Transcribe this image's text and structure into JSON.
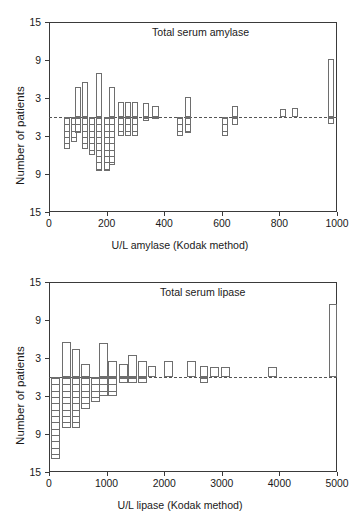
{
  "figure": {
    "panels": [
      {
        "id": "amylase",
        "title": "Total serum amylase",
        "ylabel": "Number of patients",
        "xlabel": "U/L amylase (Kodak method)"
      },
      {
        "id": "lipase",
        "title": "Total serum lipase",
        "ylabel": "Number of patients",
        "xlabel": "U/L lipase (Kodak method)"
      }
    ]
  },
  "chart_data": [
    {
      "type": "bar",
      "id": "amylase",
      "title": "Total serum amylase",
      "xlabel": "U/L amylase (Kodak method)",
      "ylabel": "Number of patients",
      "xlim": [
        0,
        1000
      ],
      "xticks": [
        0,
        200,
        400,
        600,
        800,
        1000
      ],
      "xticklabels": [
        "0",
        "200",
        "400",
        "600",
        "800",
        "1000"
      ],
      "ylim": [
        -15,
        15
      ],
      "yticks": [
        15,
        9,
        3,
        -3,
        -9,
        -15
      ],
      "yticklabels": [
        "15",
        "9",
        "3",
        "3",
        "9",
        "15"
      ],
      "grid": false,
      "legend": null,
      "baseline": 0,
      "baseline_style": "dashed",
      "note": "Bidirectional bars: open bars above the zero baseline, horizontally hatched bars below; bin width 25 U/L.",
      "bins": [
        {
          "x": 62,
          "up": 0,
          "down": 5
        },
        {
          "x": 87,
          "up": 0,
          "down": 4
        },
        {
          "x": 100,
          "up": 4.7,
          "down": 2.5
        },
        {
          "x": 125,
          "up": 5.5,
          "down": 5
        },
        {
          "x": 150,
          "up": 0,
          "down": 6
        },
        {
          "x": 175,
          "up": 7.0,
          "down": 8.5
        },
        {
          "x": 200,
          "up": 0,
          "down": 8.5
        },
        {
          "x": 218,
          "up": 4.7,
          "down": 7.5
        },
        {
          "x": 250,
          "up": 2.4,
          "down": 3
        },
        {
          "x": 275,
          "up": 2.4,
          "down": 3
        },
        {
          "x": 300,
          "up": 2.4,
          "down": 3
        },
        {
          "x": 337,
          "up": 2.2,
          "down": 0.6
        },
        {
          "x": 370,
          "up": 1.7,
          "down": 0.3
        },
        {
          "x": 455,
          "up": 0,
          "down": 3
        },
        {
          "x": 482,
          "up": 3.2,
          "down": 2.5
        },
        {
          "x": 612,
          "up": 0,
          "down": 3
        },
        {
          "x": 645,
          "up": 1.8,
          "down": 1.3
        },
        {
          "x": 812,
          "up": 1.3,
          "down": 0
        },
        {
          "x": 855,
          "up": 1.4,
          "down": 0
        },
        {
          "x": 980,
          "up": 9.2,
          "down": 1.1
        }
      ],
      "series": [
        {
          "name": "patients above baseline",
          "values": [
            0,
            0,
            4.7,
            5.5,
            0,
            7.0,
            0,
            4.7,
            2.4,
            2.4,
            2.4,
            2.2,
            1.7,
            0,
            3.2,
            0,
            1.8,
            1.3,
            1.4,
            9.2
          ]
        },
        {
          "name": "patients below baseline",
          "values": [
            5,
            4,
            2.5,
            5,
            6,
            8.5,
            8.5,
            7.5,
            3,
            3,
            3,
            0.6,
            0.3,
            3,
            2.5,
            3,
            1.3,
            0,
            0,
            1.1
          ]
        }
      ]
    },
    {
      "type": "bar",
      "id": "lipase",
      "title": "Total serum lipase",
      "xlabel": "U/L lipase (Kodak method)",
      "ylabel": "Number of patients",
      "xlim": [
        0,
        5000
      ],
      "xticks": [
        0,
        1000,
        2000,
        3000,
        4000,
        5000
      ],
      "xticklabels": [
        "0",
        "1000",
        "2000",
        "3000",
        "4000",
        "5000"
      ],
      "ylim": [
        -15,
        15
      ],
      "yticks": [
        15,
        9,
        3,
        -3,
        -9,
        -15
      ],
      "yticklabels": [
        "15",
        "9",
        "3",
        "3",
        "9",
        "15"
      ],
      "grid": false,
      "legend": null,
      "baseline": 0,
      "baseline_style": "dashed",
      "note": "Bidirectional bars: open bars above the zero baseline, horizontally hatched bars below; bin width 150 U/L.",
      "bins": [
        {
          "x": 110,
          "up": 0,
          "down": 13.0
        },
        {
          "x": 300,
          "up": 5.5,
          "down": 8.0
        },
        {
          "x": 470,
          "up": 4.4,
          "down": 8.0
        },
        {
          "x": 640,
          "up": 2.0,
          "down": 5.0
        },
        {
          "x": 810,
          "up": 0,
          "down": 4.0
        },
        {
          "x": 950,
          "up": 5.3,
          "down": 3.0
        },
        {
          "x": 1100,
          "up": 2.6,
          "down": 3.0
        },
        {
          "x": 1290,
          "up": 2.0,
          "down": 1.0
        },
        {
          "x": 1450,
          "up": 3.5,
          "down": 1.0
        },
        {
          "x": 1620,
          "up": 2.6,
          "down": 1.0
        },
        {
          "x": 1790,
          "up": 1.8,
          "down": 0
        },
        {
          "x": 2080,
          "up": 2.6,
          "down": 0
        },
        {
          "x": 2480,
          "up": 2.6,
          "down": 0
        },
        {
          "x": 2690,
          "up": 1.8,
          "down": 1.0
        },
        {
          "x": 2880,
          "up": 1.6,
          "down": 0
        },
        {
          "x": 3070,
          "up": 1.6,
          "down": 0
        },
        {
          "x": 3880,
          "up": 1.6,
          "down": 0
        },
        {
          "x": 4930,
          "up": 11.5,
          "down": 0
        }
      ],
      "series": [
        {
          "name": "patients above baseline",
          "values": [
            0,
            5.5,
            4.4,
            2.0,
            0,
            5.3,
            2.6,
            2.0,
            3.5,
            2.6,
            1.8,
            2.6,
            2.6,
            1.8,
            1.6,
            1.6,
            1.6,
            11.5
          ]
        },
        {
          "name": "patients below baseline",
          "values": [
            13.0,
            8.0,
            8.0,
            5.0,
            4.0,
            3.0,
            3.0,
            1.0,
            1.0,
            1.0,
            0,
            0,
            0,
            1.0,
            0,
            0,
            0,
            0
          ]
        }
      ]
    }
  ]
}
